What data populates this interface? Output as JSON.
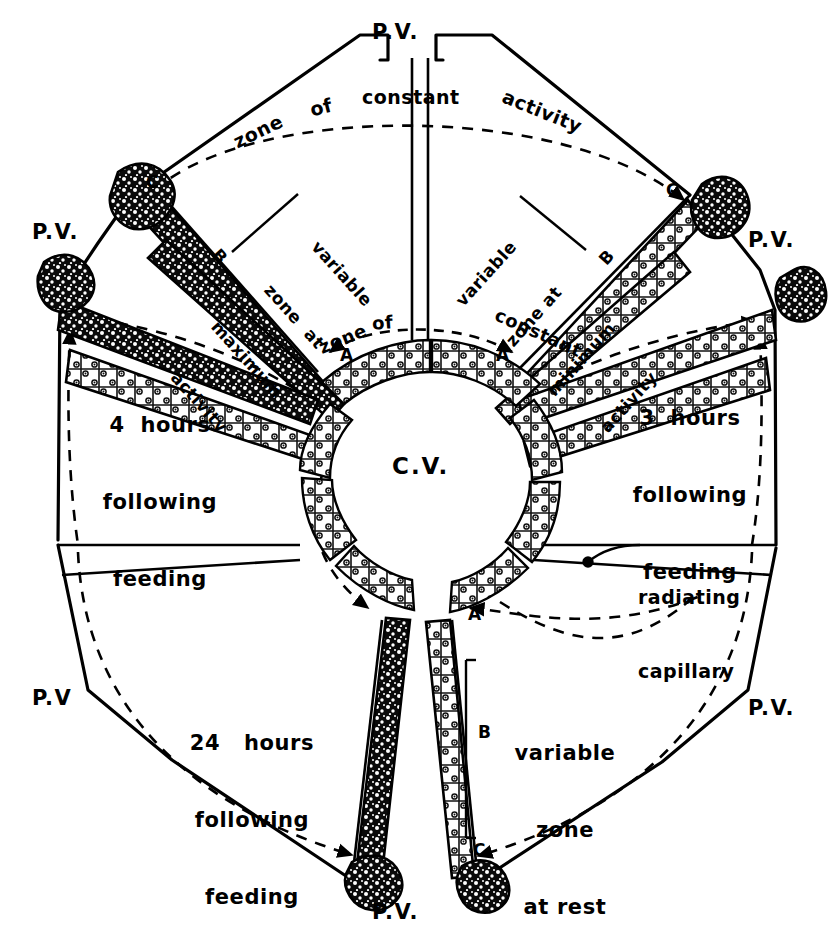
{
  "figure": {
    "center_label": "C.V.",
    "colors": {
      "ink": "#000000",
      "paper": "#ffffff"
    }
  },
  "portal_veins": [
    {
      "id": "pv-top",
      "label": "P.V.",
      "x": 400,
      "y": 22
    },
    {
      "id": "pv-upper-left",
      "label": "P.V.",
      "x": 35,
      "y": 222
    },
    {
      "id": "pv-upper-right",
      "label": "P.V.",
      "x": 752,
      "y": 230
    },
    {
      "id": "pv-lower-left",
      "label": "P.V",
      "x": 35,
      "y": 688
    },
    {
      "id": "pv-lower-right",
      "label": "P.V.",
      "x": 752,
      "y": 697
    },
    {
      "id": "pv-bottom",
      "label": "P.V.",
      "x": 400,
      "y": 903
    }
  ],
  "arc_labels": {
    "constant_activity": "zone   of   constant   activity",
    "constant_rest": "zone of constant rest"
  },
  "sectors": [
    {
      "id": "sector-upper-left",
      "name": "variable-zone-at-maximum-activity",
      "lines": [
        "variable",
        "zone  at",
        "maximum",
        "activity"
      ],
      "marker": "B",
      "endpoint_marker": "C"
    },
    {
      "id": "sector-upper-right",
      "name": "variable-zone-at-minimum-activity",
      "lines": [
        "variable",
        "zone at",
        "minimum",
        "activity"
      ],
      "marker": "B",
      "endpoint_marker": "C"
    },
    {
      "id": "sector-left",
      "name": "four-hours-following-feeding",
      "lines": [
        "4  hours",
        "following",
        "feeding"
      ]
    },
    {
      "id": "sector-right",
      "name": "three-hours-following-feeding",
      "lines": [
        "3  hours",
        "following",
        "feeding"
      ]
    },
    {
      "id": "sector-lower-left",
      "name": "twentyfour-hours-following-feeding",
      "lines": [
        "24   hours",
        "following",
        "feeding"
      ]
    },
    {
      "id": "sector-lower-right",
      "name": "variable-zone-at-rest",
      "lines": [
        "variable",
        "zone",
        "at rest"
      ],
      "marker": "B",
      "endpoint_marker": "C",
      "start_marker": "A"
    }
  ],
  "annotations": {
    "capillary": {
      "line1": "radiating",
      "line2": "capillary"
    },
    "zone_markers": [
      "A",
      "B",
      "C"
    ]
  }
}
